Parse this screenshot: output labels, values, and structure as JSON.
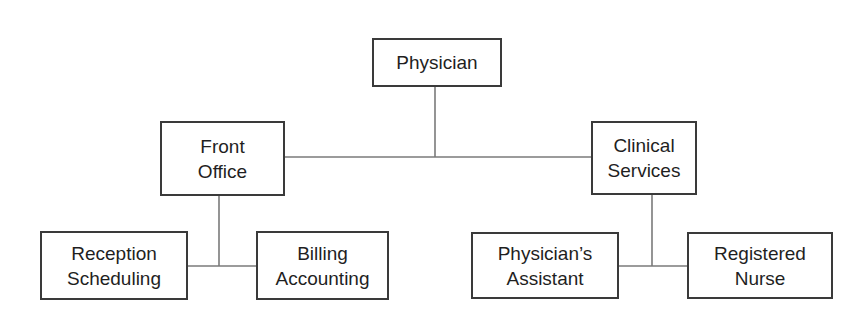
{
  "diagram": {
    "type": "org-chart",
    "colors": {
      "line": "#7a7a7a",
      "border": "#3a3a3a",
      "text": "#1f1f1f",
      "background": "#ffffff"
    },
    "nodes": {
      "physician": {
        "lines": [
          "Physician"
        ],
        "box": [
          372,
          38,
          130,
          49
        ]
      },
      "front_office": {
        "lines": [
          "Front",
          "Office"
        ],
        "box": [
          160,
          121,
          125,
          75
        ]
      },
      "clinical_services": {
        "lines": [
          "Clinical",
          "Services"
        ],
        "box": [
          591,
          121,
          106,
          74
        ]
      },
      "reception_scheduling": {
        "lines": [
          "Reception",
          "Scheduling"
        ],
        "box": [
          40,
          231,
          148,
          69
        ]
      },
      "billing_accounting": {
        "lines": [
          "Billing",
          "Accounting"
        ],
        "box": [
          256,
          231,
          133,
          69
        ]
      },
      "physicians_assistant": {
        "lines": [
          "Physician’s",
          "Assistant"
        ],
        "box": [
          471,
          232,
          148,
          67
        ]
      },
      "registered_nurse": {
        "lines": [
          "Registered",
          "Nurse"
        ],
        "box": [
          687,
          232,
          146,
          67
        ]
      }
    },
    "edges": [
      {
        "from": "physician",
        "to": "front_office"
      },
      {
        "from": "physician",
        "to": "clinical_services"
      },
      {
        "from": "front_office",
        "to": "reception_scheduling"
      },
      {
        "from": "front_office",
        "to": "billing_accounting"
      },
      {
        "from": "clinical_services",
        "to": "physicians_assistant"
      },
      {
        "from": "clinical_services",
        "to": "registered_nurse"
      }
    ]
  }
}
